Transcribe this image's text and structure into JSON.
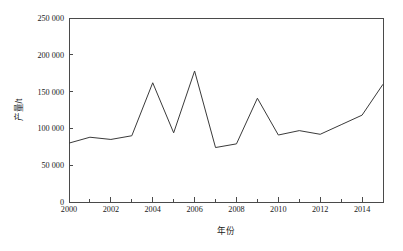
{
  "chart_data": {
    "type": "line",
    "title": "",
    "xlabel": "年份",
    "ylabel": "产量/t",
    "x": [
      2000,
      2001,
      2002,
      2003,
      2004,
      2005,
      2006,
      2007,
      2008,
      2009,
      2010,
      2011,
      2012,
      2013,
      2014,
      2015
    ],
    "values": [
      80000,
      88000,
      85000,
      90000,
      162000,
      94000,
      178000,
      74000,
      79000,
      141000,
      91000,
      97000,
      92000,
      105000,
      118000,
      160000
    ],
    "series": [
      {
        "name": "产量",
        "values": [
          80000,
          88000,
          85000,
          90000,
          162000,
          94000,
          178000,
          74000,
          79000,
          141000,
          91000,
          97000,
          92000,
          105000,
          118000,
          160000
        ]
      }
    ],
    "xlim": [
      2000,
      2015
    ],
    "ylim": [
      0,
      250000
    ],
    "y_ticks": [
      0,
      50000,
      100000,
      150000,
      200000,
      250000
    ],
    "y_tick_labels": [
      "0",
      "50 000",
      "100 000",
      "150 000",
      "200 000",
      "250 000"
    ],
    "x_ticks": [
      2000,
      2002,
      2004,
      2006,
      2008,
      2010,
      2012,
      2014
    ],
    "x_tick_labels": [
      "2000",
      "2002",
      "2004",
      "2006",
      "2008",
      "2010",
      "2012",
      "2014"
    ],
    "x_minor_ticks": [
      2001,
      2003,
      2005,
      2007,
      2009,
      2011,
      2013,
      2015
    ],
    "grid": false,
    "legend": false,
    "legend_position": "none",
    "line_color": "#3a3a3a",
    "axis_color": "#4a4a4a",
    "background_color": "#ffffff",
    "annotations": []
  }
}
